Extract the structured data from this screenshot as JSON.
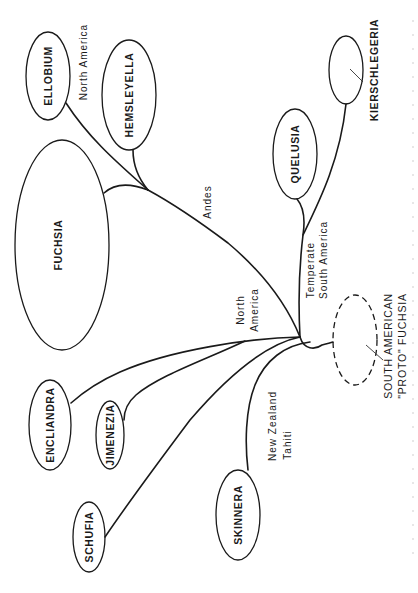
{
  "diagram": {
    "type": "phylogenetic-tree",
    "orientation": "rotated-90-ccw",
    "line_color": "#1a1a1a",
    "background": "#ffffff",
    "genera": [
      {
        "id": "ellobium",
        "label": "ELLOBIUM"
      },
      {
        "id": "hemsleyella",
        "label": "HEMSLEYELLA"
      },
      {
        "id": "fuchsia",
        "label": "FUCHSIA"
      },
      {
        "id": "quelusia",
        "label": "QUELUSIA"
      },
      {
        "id": "kierschlegeria",
        "label": "KIERSCHLEGERIA"
      },
      {
        "id": "encliandra",
        "label": "ENCLIANDRA"
      },
      {
        "id": "jimenezia",
        "label": "JIMENEZIA"
      },
      {
        "id": "schufia",
        "label": "SCHUFIA"
      },
      {
        "id": "skinnera",
        "label": "SKINNERA"
      }
    ],
    "ancestor": {
      "line1": "SOUTH AMERICAN",
      "line2": "\"PROTO\" FUCHSIA",
      "style": "dashed"
    },
    "regions": {
      "north_america_top": "North America",
      "andes": "Andes",
      "temperate_line1": "Temperate",
      "temperate_line2": "South America",
      "north_america_mid_line1": "North",
      "north_america_mid_line2": "America",
      "nz_line1": "New Zealand",
      "nz_line2": "Tahiti"
    },
    "edges": [
      {
        "from": "proto",
        "to": "hub"
      },
      {
        "from": "hub",
        "to": "andes-node",
        "label": "Andes"
      },
      {
        "from": "andes-node",
        "to": "ellobium",
        "label": "North America"
      },
      {
        "from": "andes-node",
        "to": "hemsleyella"
      },
      {
        "from": "andes-node",
        "to": "fuchsia"
      },
      {
        "from": "hub",
        "to": "quelusia",
        "label": "Temperate South America"
      },
      {
        "from": "hub",
        "to": "kierschlegeria"
      },
      {
        "from": "hub",
        "to": "encliandra",
        "label": "North America"
      },
      {
        "from": "hub",
        "to": "jimenezia"
      },
      {
        "from": "hub",
        "to": "schufia"
      },
      {
        "from": "hub",
        "to": "skinnera",
        "label": "New Zealand Tahiti"
      }
    ]
  }
}
